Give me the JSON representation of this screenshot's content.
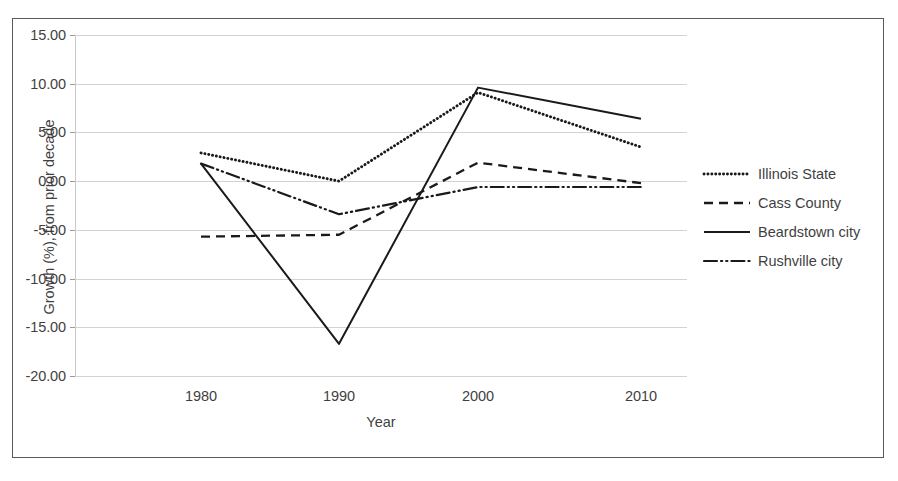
{
  "chart_data": {
    "type": "line",
    "title": "",
    "xlabel": "Year",
    "ylabel": "Growth (%), from prior decade",
    "categories": [
      "1980",
      "1990",
      "2000",
      "2010"
    ],
    "x": [
      1980,
      1990,
      2000,
      2010
    ],
    "xlim": [
      1980,
      2010
    ],
    "ylim": [
      -20,
      15
    ],
    "ytick_labels": [
      "15.00",
      "10.00",
      "5.00",
      "0.00",
      "-5.00",
      "-10.00",
      "-15.00",
      "-20.00"
    ],
    "ytick_values": [
      15,
      10,
      5,
      0,
      -5,
      -10,
      -15,
      -20
    ],
    "grid": true,
    "legend_position": "right",
    "series": [
      {
        "name": "Illinois State",
        "values": [
          2.9,
          0.0,
          9.1,
          3.5
        ],
        "style": "dotted",
        "color": "#1a1a1a"
      },
      {
        "name": "Cass County",
        "values": [
          -5.7,
          -5.5,
          1.9,
          -0.2
        ],
        "style": "dashed",
        "color": "#1a1a1a"
      },
      {
        "name": "Beardstown city",
        "values": [
          1.8,
          -16.7,
          9.6,
          6.4
        ],
        "style": "solid",
        "color": "#1a1a1a"
      },
      {
        "name": "Rushville city",
        "values": [
          1.8,
          -3.4,
          -0.6,
          -0.6
        ],
        "style": "dash-dot-dot",
        "color": "#1a1a1a"
      }
    ]
  },
  "colors": {
    "gridline": "#d3d3d3",
    "frame_border": "#5a5a5a",
    "text": "#3f3f3f",
    "plot_line": "#1a1a1a",
    "background": "#ffffff"
  }
}
